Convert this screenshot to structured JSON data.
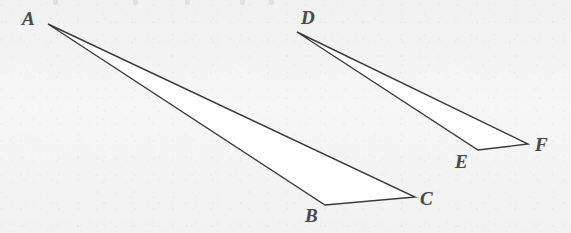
{
  "figure": {
    "caption_visible": false,
    "background_color": "#f3f3f3",
    "stroke_color": "#3a3a3a",
    "fill_color": "#ffffff",
    "label_color": "#4a4a4a",
    "width": 571,
    "height": 233,
    "triangles": [
      {
        "name": "triangle-abc",
        "vertices": [
          {
            "label": "A",
            "x": 48,
            "y": 24,
            "label_x": 22,
            "label_y": 9
          },
          {
            "label": "B",
            "x": 325,
            "y": 205,
            "label_x": 305,
            "label_y": 206
          },
          {
            "label": "C",
            "x": 415,
            "y": 197,
            "label_x": 420,
            "label_y": 189
          }
        ]
      },
      {
        "name": "triangle-def",
        "vertices": [
          {
            "label": "D",
            "x": 297,
            "y": 32,
            "label_x": 301,
            "label_y": 8
          },
          {
            "label": "E",
            "x": 478,
            "y": 150,
            "label_x": 455,
            "label_y": 152
          },
          {
            "label": "F",
            "x": 528,
            "y": 144,
            "label_x": 535,
            "label_y": 135
          }
        ]
      }
    ],
    "top_edge_artifacts": [
      {
        "name": "descender-1",
        "x": 53
      },
      {
        "name": "descender-2",
        "x": 133
      },
      {
        "name": "descender-3",
        "x": 185
      },
      {
        "name": "descender-4",
        "x": 240
      },
      {
        "name": "descender-5",
        "x": 269
      }
    ]
  }
}
